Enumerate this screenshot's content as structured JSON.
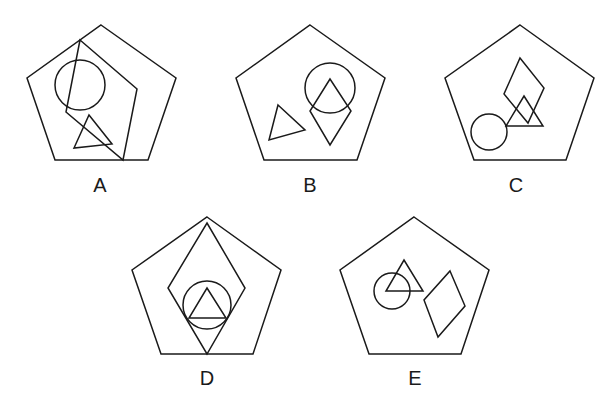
{
  "figure": {
    "options": [
      {
        "label": "A",
        "pentagon": "101,25 176,78 148,160 55,160 27,78",
        "shapes": [
          {
            "type": "quadrilateral",
            "points": "80,40 137,89 123,160 66,112"
          },
          {
            "type": "circle",
            "cx": 80,
            "cy": 85,
            "r": 25
          },
          {
            "type": "triangle",
            "points": "89,115 112,144 74,148"
          }
        ],
        "label_pos": {
          "x": 100,
          "y": 192
        }
      },
      {
        "label": "B",
        "pentagon": "310,25 385,78 357,160 264,160 236,78",
        "shapes": [
          {
            "type": "circle",
            "cx": 330,
            "cy": 88,
            "r": 25
          },
          {
            "type": "diamond",
            "points": "330,79 351,111 330,145 310,111"
          },
          {
            "type": "triangle",
            "points": "278,105 305,130 269,140"
          }
        ],
        "label_pos": {
          "x": 310,
          "y": 192
        }
      },
      {
        "label": "C",
        "pentagon": "520,25 594,78 566,160 474,160 445,78",
        "shapes": [
          {
            "type": "diamond",
            "points": "520,58 544,88 528,123 504,94"
          },
          {
            "type": "triangle",
            "points": "524,96 543,126 506,126"
          },
          {
            "type": "circle",
            "cx": 489,
            "cy": 132,
            "r": 18
          }
        ],
        "label_pos": {
          "x": 516,
          "y": 192
        }
      },
      {
        "label": "D",
        "pentagon": "207,217 281,270 253,354 161,354 132,270",
        "shapes": [
          {
            "type": "diamond",
            "points": "207,223 245,288 207,354 168,288"
          },
          {
            "type": "circle",
            "cx": 207,
            "cy": 305,
            "r": 24
          },
          {
            "type": "triangle",
            "points": "207,288 226,318 189,318"
          }
        ],
        "label_pos": {
          "x": 207,
          "y": 385
        }
      },
      {
        "label": "E",
        "pentagon": "414,217 489,270 461,354 369,354 340,270",
        "shapes": [
          {
            "type": "circle",
            "cx": 392,
            "cy": 291,
            "r": 18
          },
          {
            "type": "triangle",
            "points": "404,260 423,291 386,291"
          },
          {
            "type": "diamond",
            "points": "450,271 465,306 438,337 424,300"
          }
        ],
        "label_pos": {
          "x": 415,
          "y": 385
        }
      }
    ]
  }
}
